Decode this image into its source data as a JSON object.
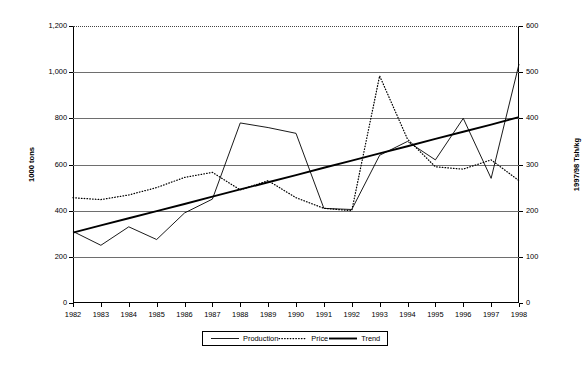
{
  "chart_data": {
    "type": "line",
    "title": "",
    "xlabel": "",
    "x": [
      1982,
      1983,
      1984,
      1985,
      1986,
      1987,
      1988,
      1989,
      1990,
      1991,
      1992,
      1993,
      1994,
      1995,
      1996,
      1997,
      1998
    ],
    "categories": [
      "1982",
      "1983",
      "1984",
      "1985",
      "1986",
      "1987",
      "1988",
      "1989",
      "1990",
      "1991",
      "1992",
      "1993",
      "1994",
      "1995",
      "1996",
      "1997",
      "1998"
    ],
    "grid": true,
    "legend_position": "bottom",
    "axes": {
      "left": {
        "label": "1000 tons",
        "ylim": [
          0,
          1200
        ],
        "tick_step": 200,
        "ticks": [
          "0",
          "200",
          "400",
          "600",
          "800",
          "1,000",
          "1,200"
        ],
        "tick_values": [
          0,
          200,
          400,
          600,
          800,
          1000,
          1200
        ]
      },
      "right": {
        "label": "1997/98 Tsh/kg",
        "ylim": [
          0,
          600
        ],
        "tick_step": 100,
        "ticks": [
          "0",
          "100",
          "200",
          "300",
          "400",
          "500",
          "600"
        ],
        "tick_values": [
          0,
          100,
          200,
          300,
          400,
          500,
          600
        ]
      }
    },
    "series": [
      {
        "name": "Production",
        "axis": "left",
        "unit": "1000 tons",
        "style": "thin-solid",
        "values": [
          310,
          250,
          330,
          275,
          390,
          450,
          780,
          760,
          735,
          410,
          405,
          640,
          700,
          620,
          800,
          540,
          1035
        ]
      },
      {
        "name": "Price",
        "axis": "right",
        "unit": "1997/98 Tsh/kg",
        "style": "dotted",
        "values": [
          228,
          224,
          234,
          250,
          272,
          283,
          245,
          265,
          228,
          205,
          200,
          492,
          355,
          295,
          290,
          310,
          265
        ],
        "values_left_scale": [
          455,
          447,
          468,
          500,
          543,
          565,
          490,
          530,
          455,
          410,
          400,
          985,
          710,
          590,
          580,
          620,
          530
        ]
      },
      {
        "name": "Trend",
        "axis": "left",
        "unit": "1000 tons",
        "style": "thick-solid",
        "values": [
          305,
          336,
          367,
          398,
          429,
          461,
          492,
          523,
          554,
          586,
          617,
          648,
          679,
          711,
          742,
          773,
          805
        ]
      }
    ]
  },
  "legend": {
    "items": [
      {
        "label": "Production",
        "swatch": "thin-solid"
      },
      {
        "label": "Price",
        "swatch": "dotted"
      },
      {
        "label": "Trend",
        "swatch": "thick-solid"
      }
    ]
  }
}
